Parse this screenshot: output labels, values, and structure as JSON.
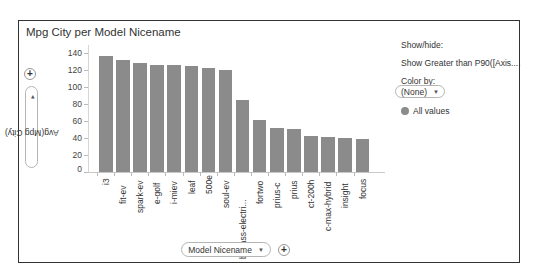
{
  "chart_data": {
    "type": "bar",
    "title": "Mpg City per Model Nicename",
    "xlabel": "Model Nicename",
    "ylabel": "Avg(Mpg City)",
    "ylim": [
      0,
      150
    ],
    "yticks": [
      0,
      20,
      40,
      60,
      80,
      100,
      120,
      140
    ],
    "categories": [
      "i3",
      "fit-ev",
      "spark-ev",
      "e-golf",
      "i-miev",
      "leaf",
      "500e",
      "soul-ev",
      "b-class-electri...",
      "fortwo",
      "prius-c",
      "prius",
      "ct-200h",
      "c-max-hybrid",
      "insight",
      "focus"
    ],
    "values": [
      137,
      132,
      128,
      126,
      126,
      125,
      122,
      120,
      85,
      61,
      52,
      51,
      42,
      41,
      40,
      39
    ],
    "bar_color": "#8b8b8b",
    "legend_position": "right",
    "grid": false
  },
  "axis": {
    "y_selector_label": "Avg(Mpg City)",
    "x_selector_label": "Model Nicename",
    "y_add_label": "+",
    "x_add_label": "+",
    "caret": "▼"
  },
  "side_panel": {
    "show_hide_label": "Show/hide:",
    "filter_label": "Show Greater than P90([Axis....",
    "color_by_label": "Color by:",
    "color_by_value": "(None)",
    "legend_item": "All values"
  }
}
